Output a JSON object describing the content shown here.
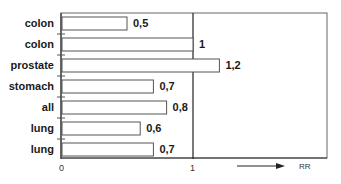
{
  "chart_data": {
    "type": "bar",
    "orientation": "horizontal",
    "title": "",
    "xlabel": "RR",
    "ylabel": "",
    "categories": [
      "colon",
      "colon",
      "prostate",
      "stomach",
      "all",
      "lung",
      "lung"
    ],
    "values": [
      0.5,
      1,
      1.2,
      0.7,
      0.8,
      0.6,
      0.7
    ],
    "value_labels": [
      "0,5",
      "1",
      "1,2",
      "0,7",
      "0,8",
      "0,6",
      "0,7"
    ],
    "x_ticks": [
      0,
      1
    ],
    "x_tick_labels": [
      "0",
      "1"
    ],
    "xlim": [
      0,
      2.0
    ],
    "reference_line": 1,
    "grid": false,
    "legend": null,
    "annotations": [
      {
        "text": "RR",
        "type": "arrow-label",
        "direction": "right"
      }
    ]
  },
  "colors": {
    "bar_fill": "#ffffff",
    "bar_stroke": "#555555",
    "axis": "#333333",
    "frame": "#666666"
  }
}
